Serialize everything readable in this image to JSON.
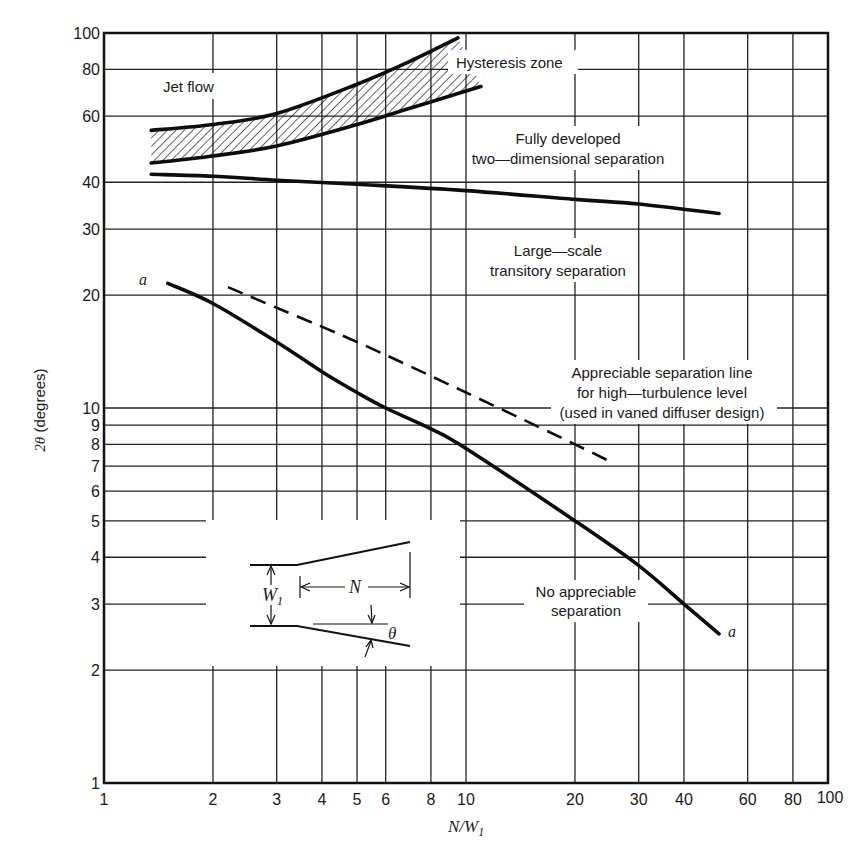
{
  "chart_data": {
    "type": "line",
    "title": "",
    "xlabel": "N/W1",
    "xlabel_display": {
      "main": "N/W",
      "sub": "1"
    },
    "ylabel": "2θ (degrees)",
    "xscale": "log",
    "yscale": "log",
    "xlim": [
      1,
      100
    ],
    "ylim": [
      1,
      100
    ],
    "grid": true,
    "x_ticks": [
      1,
      2,
      3,
      4,
      5,
      6,
      8,
      10,
      20,
      30,
      40,
      60,
      80,
      100
    ],
    "x_tick_labels": [
      "1",
      "2",
      "3",
      "4",
      "5",
      "6",
      "8",
      "10",
      "20",
      "30",
      "40",
      "60",
      "80",
      "100"
    ],
    "y_ticks": [
      1,
      2,
      3,
      4,
      5,
      6,
      7,
      8,
      9,
      10,
      20,
      30,
      40,
      60,
      80,
      100
    ],
    "y_tick_labels": [
      "1",
      "2",
      "3",
      "4",
      "5",
      "6",
      "7",
      "8",
      "9",
      "10",
      "20",
      "30",
      "40",
      "60",
      "80",
      "100"
    ],
    "series": [
      {
        "name": "Hysteresis zone upper bound (jet flow boundary)",
        "style": "solid-thick",
        "x": [
          1.35,
          2,
          3,
          5,
          7,
          9.5
        ],
        "y": [
          55,
          57,
          61,
          73,
          84,
          97
        ]
      },
      {
        "name": "Hysteresis zone lower bound",
        "style": "solid-thick",
        "x": [
          1.35,
          2,
          3,
          5,
          7,
          10,
          11
        ],
        "y": [
          45,
          47,
          50,
          57,
          63,
          70,
          72
        ]
      },
      {
        "name": "Fully developed two-dimensional separation boundary",
        "style": "solid-thick",
        "x": [
          1.35,
          2,
          3,
          5,
          10,
          20,
          30,
          50
        ],
        "y": [
          42,
          41.5,
          40.5,
          39.5,
          38,
          36,
          35,
          33
        ]
      },
      {
        "name": "a-a: No appreciable separation boundary",
        "style": "solid-thick",
        "x": [
          1.5,
          2,
          3,
          4,
          5,
          6,
          8,
          10,
          20,
          30,
          40,
          50
        ],
        "y": [
          21.5,
          19,
          15,
          12.5,
          11,
          10,
          8.8,
          7.8,
          5,
          3.8,
          3,
          2.5
        ]
      },
      {
        "name": "Appreciable separation line for high-turbulence level",
        "style": "dashed",
        "x": [
          2.2,
          3,
          5,
          10,
          20,
          25
        ],
        "y": [
          21,
          18.5,
          15,
          11,
          8,
          7.2
        ]
      }
    ],
    "shaded_regions": [
      {
        "name": "Hysteresis zone",
        "pattern": "diagonal-hatch",
        "between": [
          "Hysteresis zone upper bound (jet flow boundary)",
          "Hysteresis zone lower bound"
        ]
      }
    ],
    "annotations": [
      {
        "text": "Jet flow",
        "x": 1.9,
        "y": 75
      },
      {
        "text": "Hysteresis zone",
        "x": 15,
        "y": 82
      },
      {
        "text": "Fully developed two-dimensional separation",
        "x": 17,
        "y": 50
      },
      {
        "text": "Large-scale transitory separation",
        "x": 16,
        "y": 26
      },
      {
        "text": "Appreciable separation line for high-turbulence level (used in vaned diffuser design)",
        "x": 28,
        "y": 11
      },
      {
        "text": "No appreciable separation",
        "x": 20,
        "y": 3
      },
      {
        "text": "a",
        "x": 1.4,
        "y": 22
      },
      {
        "text": "a",
        "x": 55,
        "y": 2.5
      }
    ],
    "legend": "none",
    "inset": {
      "description": "Diffuser geometry sketch",
      "labels": [
        "W1",
        "N",
        "θ"
      ]
    }
  },
  "labels": {
    "jet_flow": "Jet flow",
    "hysteresis": "Hysteresis zone",
    "fully_dev_1": "Fully developed",
    "fully_dev_2": "two—dimensional separation",
    "large_scale_1": "Large—scale",
    "large_scale_2": "transitory separation",
    "appreciable_1": "Appreciable separation line",
    "appreciable_2": "for high—turbulence level",
    "appreciable_3": "(used in vaned diffuser design)",
    "no_sep_1": "No appreciable",
    "no_sep_2": "separation",
    "curve_end_a_start": "a",
    "curve_end_a_end": "a",
    "ylabel_theta": "2θ",
    "ylabel_units": " (degrees)",
    "inset_w": "W",
    "inset_w_sub": "1",
    "inset_n": "N",
    "inset_theta": "θ"
  }
}
